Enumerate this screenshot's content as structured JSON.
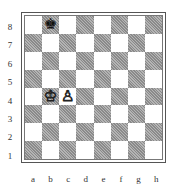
{
  "board": {
    "ranks": [
      "8",
      "7",
      "6",
      "5",
      "4",
      "3",
      "2",
      "1"
    ],
    "files": [
      "a",
      "b",
      "c",
      "d",
      "e",
      "f",
      "g",
      "h"
    ],
    "colors": {
      "light": "#ffffff",
      "dark": "#9a9a9a",
      "border": "#555555"
    },
    "pieces": [
      {
        "square": "b8",
        "piece": "king",
        "color": "black",
        "glyph": "♚"
      },
      {
        "square": "b4",
        "piece": "king",
        "color": "white",
        "glyph": "♔"
      },
      {
        "square": "c4",
        "piece": "pawn",
        "color": "white",
        "glyph": "♙"
      }
    ]
  }
}
